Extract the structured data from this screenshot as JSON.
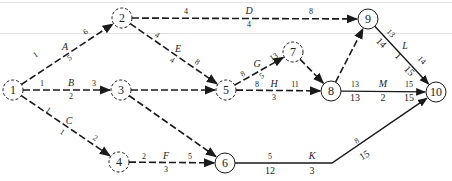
{
  "diagram": {
    "type": "activity-on-arrow network",
    "nodes": [
      {
        "id": "1",
        "x": 13,
        "y": 90,
        "style": "dashed"
      },
      {
        "id": "2",
        "x": 122,
        "y": 18,
        "style": "dashed"
      },
      {
        "id": "3",
        "x": 121,
        "y": 90,
        "style": "dashed"
      },
      {
        "id": "4",
        "x": 119,
        "y": 162,
        "style": "dashed"
      },
      {
        "id": "5",
        "x": 226,
        "y": 90,
        "style": "dashed"
      },
      {
        "id": "6",
        "x": 225,
        "y": 163,
        "style": "solid"
      },
      {
        "id": "7",
        "x": 293,
        "y": 52,
        "style": "dashed"
      },
      {
        "id": "8",
        "x": 331,
        "y": 91,
        "style": "solid"
      },
      {
        "id": "9",
        "x": 368,
        "y": 19,
        "style": "solid"
      },
      {
        "id": "10",
        "x": 436,
        "y": 92,
        "style": "solid"
      }
    ],
    "activities": [
      {
        "name": "A",
        "from": "1",
        "to": "2",
        "style": "dashed",
        "labels": [
          {
            "t": "1",
            "x": 37,
            "y": 57,
            "c": "num",
            "r": -34
          },
          {
            "t": "A",
            "x": 65,
            "y": 50,
            "c": "act"
          },
          {
            "t": "5",
            "x": 71,
            "y": 60,
            "c": "num",
            "r": -34
          },
          {
            "t": "6",
            "x": 87,
            "y": 34,
            "c": "num",
            "r": -34
          }
        ]
      },
      {
        "name": "B",
        "from": "1",
        "to": "3",
        "style": "dashed",
        "labels": [
          {
            "t": "1",
            "x": 42,
            "y": 86,
            "c": "num"
          },
          {
            "t": "B",
            "x": 71,
            "y": 86,
            "c": "act"
          },
          {
            "t": "3",
            "x": 94,
            "y": 86,
            "c": "num"
          },
          {
            "t": "2",
            "x": 71,
            "y": 99,
            "c": "num"
          }
        ]
      },
      {
        "name": "C",
        "from": "1",
        "to": "4",
        "style": "dashed",
        "labels": [
          {
            "t": "1",
            "x": 47,
            "y": 112,
            "c": "num",
            "r": 33
          },
          {
            "t": "C",
            "x": 69,
            "y": 124,
            "c": "act"
          },
          {
            "t": "1",
            "x": 61,
            "y": 134,
            "c": "num",
            "r": 33
          },
          {
            "t": "2",
            "x": 94,
            "y": 140,
            "c": "num",
            "r": 33
          }
        ]
      },
      {
        "name": "D",
        "from": "2",
        "to": "9",
        "style": "dashed",
        "labels": [
          {
            "t": "4",
            "x": 186,
            "y": 14,
            "c": "num"
          },
          {
            "t": "D",
            "x": 249,
            "y": 14,
            "c": "act"
          },
          {
            "t": "8",
            "x": 311,
            "y": 14,
            "c": "num"
          },
          {
            "t": "4",
            "x": 249,
            "y": 27,
            "c": "num"
          }
        ]
      },
      {
        "name": "E",
        "from": "2",
        "to": "5",
        "style": "dashed",
        "labels": [
          {
            "t": "4",
            "x": 156,
            "y": 37,
            "c": "num",
            "r": 34
          },
          {
            "t": "E",
            "x": 178,
            "y": 52,
            "c": "act"
          },
          {
            "t": "4",
            "x": 171,
            "y": 62,
            "c": "num",
            "r": 34
          },
          {
            "t": "8",
            "x": 196,
            "y": 64,
            "c": "num",
            "r": 34
          }
        ]
      },
      {
        "name": "dummy-3-5",
        "from": "3",
        "to": "5",
        "style": "dashed",
        "labels": []
      },
      {
        "name": "dummy-3-6",
        "from": "3",
        "to": "6",
        "style": "dashed",
        "labels": []
      },
      {
        "name": "F",
        "from": "4",
        "to": "6",
        "style": "dashed",
        "labels": [
          {
            "t": "2",
            "x": 144,
            "y": 159,
            "c": "num"
          },
          {
            "t": "F",
            "x": 166,
            "y": 159,
            "c": "act"
          },
          {
            "t": "5",
            "x": 190,
            "y": 159,
            "c": "num"
          },
          {
            "t": "3",
            "x": 166,
            "y": 172,
            "c": "num"
          }
        ]
      },
      {
        "name": "G",
        "from": "5",
        "to": "7",
        "style": "dashed",
        "labels": [
          {
            "t": "8",
            "x": 244,
            "y": 76,
            "c": "num",
            "r": -30
          },
          {
            "t": "G",
            "x": 257,
            "y": 67,
            "c": "act"
          },
          {
            "t": "5",
            "x": 263,
            "y": 78,
            "c": "num",
            "r": -30
          },
          {
            "t": "13",
            "x": 275,
            "y": 59,
            "c": "num",
            "r": -30
          }
        ]
      },
      {
        "name": "H",
        "from": "5",
        "to": "8",
        "style": "dashed",
        "labels": [
          {
            "t": "8",
            "x": 257,
            "y": 87,
            "c": "num"
          },
          {
            "t": "H",
            "x": 274,
            "y": 87,
            "c": "act"
          },
          {
            "t": "11",
            "x": 295,
            "y": 87,
            "c": "num"
          },
          {
            "t": "3",
            "x": 274,
            "y": 100,
            "c": "num"
          }
        ]
      },
      {
        "name": "dummy-7-8",
        "from": "7",
        "to": "8",
        "style": "dashed",
        "labels": []
      },
      {
        "name": "dummy-8-9",
        "from": "8",
        "to": "9",
        "style": "dashed",
        "labels": []
      },
      {
        "name": "K",
        "from": "6",
        "to": "10",
        "style": "solid",
        "via": [
          332,
          163
        ],
        "labels": [
          {
            "t": "5",
            "x": 270,
            "y": 159,
            "c": "num"
          },
          {
            "t": "K",
            "x": 312,
            "y": 159,
            "c": "act"
          },
          {
            "t": "12",
            "x": 270,
            "y": 174,
            "c": "big"
          },
          {
            "t": "3",
            "x": 312,
            "y": 174,
            "c": "big"
          },
          {
            "t": "8",
            "x": 358,
            "y": 143,
            "c": "num",
            "r": -30
          },
          {
            "t": "15",
            "x": 366,
            "y": 158,
            "c": "big",
            "r": -30
          }
        ]
      },
      {
        "name": "L",
        "from": "9",
        "to": "10",
        "style": "solid",
        "labels": [
          {
            "t": "13",
            "x": 389,
            "y": 35,
            "c": "num",
            "r": 46
          },
          {
            "t": "14",
            "x": 379,
            "y": 45,
            "c": "big",
            "r": 46
          },
          {
            "t": "L",
            "x": 405,
            "y": 49,
            "c": "act"
          },
          {
            "t": "1",
            "x": 396,
            "y": 58,
            "c": "big",
            "r": 46
          },
          {
            "t": "14",
            "x": 420,
            "y": 62,
            "c": "num",
            "r": 46
          },
          {
            "t": "15",
            "x": 407,
            "y": 73,
            "c": "big",
            "r": 46
          }
        ]
      },
      {
        "name": "M",
        "from": "8",
        "to": "10",
        "style": "solid",
        "labels": [
          {
            "t": "13",
            "x": 355,
            "y": 87,
            "c": "num"
          },
          {
            "t": "M",
            "x": 383,
            "y": 87,
            "c": "act"
          },
          {
            "t": "15",
            "x": 409,
            "y": 87,
            "c": "num"
          },
          {
            "t": "13",
            "x": 355,
            "y": 101,
            "c": "big"
          },
          {
            "t": "2",
            "x": 383,
            "y": 101,
            "c": "big"
          },
          {
            "t": "15",
            "x": 409,
            "y": 101,
            "c": "big"
          }
        ]
      }
    ],
    "colors": {
      "ink": "#1a1a1a",
      "rule": "#e2e2e2"
    }
  }
}
